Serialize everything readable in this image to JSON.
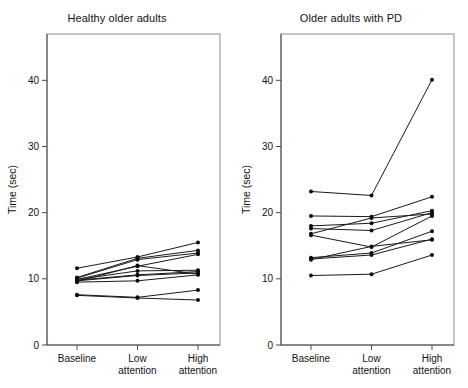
{
  "figure": {
    "width": 468,
    "height": 388,
    "background": "#ffffff",
    "ink_color": "#1a1a1a"
  },
  "chart_data": [
    {
      "type": "line",
      "panel_id": "healthy-older-adults",
      "title": "Healthy older adults",
      "xlabel": "",
      "ylabel": "Time (sec)",
      "categories": [
        "Baseline",
        "Low\nattention",
        "High\nattention"
      ],
      "category_labels": [
        {
          "line1": "Baseline",
          "line2": ""
        },
        {
          "line1": "Low",
          "line2": "attention"
        },
        {
          "line1": "High",
          "line2": "attention"
        }
      ],
      "ylim": [
        0,
        47
      ],
      "yticks": [
        0,
        10,
        20,
        30,
        40
      ],
      "ytick_labels": [
        "0",
        "10",
        "20",
        "30",
        "40"
      ],
      "grid": false,
      "legend": "none",
      "marker": "filled-circle",
      "series": [
        {
          "name": "S1",
          "values": [
            11.6,
            13.3,
            15.5
          ]
        },
        {
          "name": "S2",
          "values": [
            10.2,
            13.1,
            14.3
          ]
        },
        {
          "name": "S3",
          "values": [
            10.1,
            12.9,
            13.9
          ]
        },
        {
          "name": "S4",
          "values": [
            9.9,
            11.9,
            13.7
          ]
        },
        {
          "name": "S5",
          "values": [
            9.9,
            11.2,
            11.3
          ]
        },
        {
          "name": "S6",
          "values": [
            9.8,
            10.6,
            11.1
          ]
        },
        {
          "name": "S7",
          "values": [
            9.7,
            10.5,
            10.9
          ]
        },
        {
          "name": "S8",
          "values": [
            9.6,
            12.0,
            10.7
          ]
        },
        {
          "name": "S9",
          "values": [
            9.5,
            9.7,
            10.6
          ]
        },
        {
          "name": "S10",
          "values": [
            7.6,
            7.2,
            8.3
          ]
        },
        {
          "name": "S11",
          "values": [
            7.5,
            7.1,
            6.8
          ]
        }
      ]
    },
    {
      "type": "line",
      "panel_id": "older-adults-with-pd",
      "title": "Older adults with PD",
      "xlabel": "",
      "ylabel": "Time (sec)",
      "categories": [
        "Baseline",
        "Low\nattention",
        "High\nattention"
      ],
      "category_labels": [
        {
          "line1": "Baseline",
          "line2": ""
        },
        {
          "line1": "Low",
          "line2": "attention"
        },
        {
          "line1": "High",
          "line2": "attention"
        }
      ],
      "ylim": [
        0,
        47
      ],
      "yticks": [
        0,
        10,
        20,
        30,
        40
      ],
      "ytick_labels": [
        "0",
        "10",
        "20",
        "30",
        "40"
      ],
      "grid": false,
      "legend": "none",
      "marker": "filled-circle",
      "series": [
        {
          "name": "P1",
          "values": [
            23.2,
            22.6,
            40.1
          ]
        },
        {
          "name": "P2",
          "values": [
            19.5,
            19.4,
            22.4
          ]
        },
        {
          "name": "P3",
          "values": [
            18.0,
            18.4,
            20.3
          ]
        },
        {
          "name": "P4",
          "values": [
            17.6,
            17.3,
            20.0
          ]
        },
        {
          "name": "P5",
          "values": [
            16.8,
            19.2,
            19.8
          ]
        },
        {
          "name": "P6",
          "values": [
            16.6,
            14.8,
            19.5
          ]
        },
        {
          "name": "P7",
          "values": [
            13.2,
            13.9,
            17.2
          ]
        },
        {
          "name": "P8",
          "values": [
            13.0,
            13.6,
            16.0
          ]
        },
        {
          "name": "P9",
          "values": [
            12.9,
            14.9,
            15.9
          ]
        },
        {
          "name": "P10",
          "values": [
            10.5,
            10.7,
            13.6
          ]
        }
      ]
    }
  ]
}
